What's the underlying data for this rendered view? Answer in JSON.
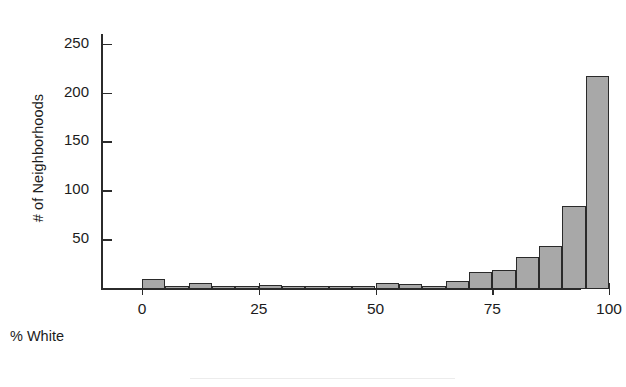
{
  "chart_data": {
    "type": "bar",
    "title": "",
    "subtitle": "",
    "xlabel": "% White",
    "ylabel": "# of Neighborhoods",
    "xlim": [
      0,
      100
    ],
    "ylim": [
      0,
      260
    ],
    "grid": false,
    "legend": null,
    "bin_width": 5,
    "xticks": [
      0,
      25,
      50,
      75,
      100
    ],
    "xticklabels": [
      "0",
      "25",
      "50",
      "75",
      "100"
    ],
    "yticks": [
      50,
      100,
      150,
      200,
      250
    ],
    "yticklabels": [
      "50",
      "100",
      "150",
      "200",
      "250"
    ],
    "categories": [
      "0-5",
      "5-10",
      "10-15",
      "15-20",
      "20-25",
      "25-30",
      "30-35",
      "35-40",
      "40-45",
      "45-50",
      "50-55",
      "55-60",
      "60-65",
      "65-70",
      "70-75",
      "75-80",
      "80-85",
      "85-90",
      "90-95",
      "95-100"
    ],
    "bin_starts": [
      0,
      5,
      10,
      15,
      20,
      25,
      30,
      35,
      40,
      45,
      50,
      55,
      60,
      65,
      70,
      75,
      80,
      85,
      90,
      95
    ],
    "values": [
      10,
      2,
      6,
      1,
      1,
      4,
      3,
      1,
      2,
      3,
      6,
      5,
      2,
      8,
      17,
      19,
      33,
      44,
      85,
      218
    ],
    "bar_fill": "#a8a8a8",
    "bar_edge": "#2a2a2a",
    "axis_color": "#2b2b2b",
    "background": "#ffffff"
  },
  "axes": {
    "y_label_text": "# of Neighborhoods",
    "x_label_text": "% White"
  }
}
